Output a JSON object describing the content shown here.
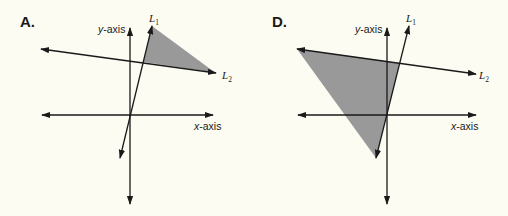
{
  "colors": {
    "background": "#fdfcf2",
    "shading": "#999999",
    "ink": "#1a1a1a"
  },
  "panels": [
    {
      "label": "A.",
      "y_axis_label": "y-axis",
      "x_axis_label": "x-axis",
      "line1": {
        "name": "L",
        "sub": "1"
      },
      "line2": {
        "name": "L",
        "sub": "2"
      },
      "shaded_region": "triangle above L2, right of L1"
    },
    {
      "label": "D.",
      "y_axis_label": "y-axis",
      "x_axis_label": "x-axis",
      "line1": {
        "name": "L",
        "sub": "1"
      },
      "line2": {
        "name": "L",
        "sub": "2"
      },
      "shaded_region": "triangle below L2, left of L1"
    }
  ]
}
